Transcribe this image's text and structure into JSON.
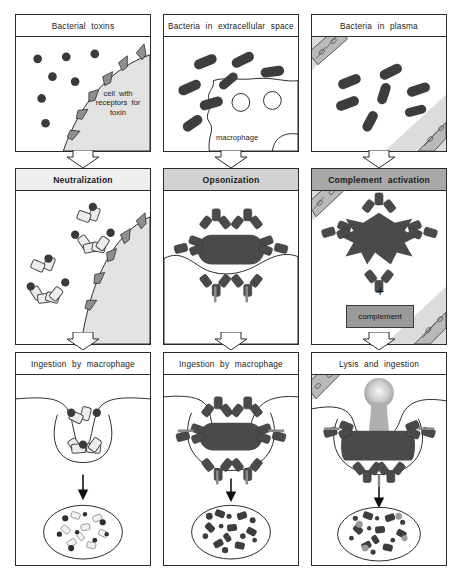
{
  "figure": {
    "columns": [
      {
        "id": "neutralization",
        "row1_title": "Bacterial toxins",
        "row1_annotation": "cell with receptors for toxin",
        "row2_title": "Neutralization",
        "row2_bar_shade": "#efefef",
        "row3_title": "Ingestion by macrophage"
      },
      {
        "id": "opsonization",
        "row1_title": "Bacteria in extracellular space",
        "row1_annotation": "macrophage",
        "row2_title": "Opsonization",
        "row2_bar_shade": "#d2d2d2",
        "row3_title": "Ingestion by macrophage"
      },
      {
        "id": "complement-activation",
        "row1_title": "Bacteria in plasma",
        "row1_annotation": "",
        "row2_title": "Complement  activation",
        "row2_bar_shade": "#a8a8a8",
        "row2_operator": "+",
        "row2_box_label": "complement",
        "row3_title": "Lysis and ingestion"
      }
    ],
    "colors": {
      "outline": "#2b2b2b",
      "toxin_dot": "#3a3a3a",
      "bacterium": "#4a4a4a",
      "cell_fill": "#e2e2e2",
      "antibody_light": "#e8e8e8",
      "antibody_dark": "#4a4a4a",
      "vessel_fill": "#dcdcdc",
      "complement_box": "#9a9a9a"
    },
    "counts": {
      "toxin_dots_row1": 7,
      "bacteria_row1_extracellular": 7,
      "bacteria_row1_plasma": 7,
      "macrophage_vacuoles": 2,
      "antibody_toxin_complexes_row2": 2
    }
  }
}
